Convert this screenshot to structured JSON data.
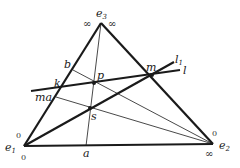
{
  "diagram": {
    "type": "projective-geometry",
    "colors": {
      "stroke": "#1a1a1a",
      "background": "#ffffff"
    },
    "vertices": {
      "e1": {
        "label": "e",
        "sub": "1",
        "top_mark": "0",
        "bottom_mark": "0"
      },
      "e2": {
        "label": "e",
        "sub": "2",
        "top_mark": "0",
        "bottom_mark": "∞"
      },
      "e3": {
        "label": "e",
        "sub": "3",
        "left_mark": "∞",
        "right_mark": "∞"
      }
    },
    "points": {
      "a": "a",
      "b": "b",
      "k": "k",
      "ma": "ma",
      "p": "p",
      "s": "s",
      "m": "m"
    },
    "lines": {
      "l": {
        "label": "l"
      },
      "l1": {
        "label": "l",
        "sub": "1"
      }
    }
  }
}
